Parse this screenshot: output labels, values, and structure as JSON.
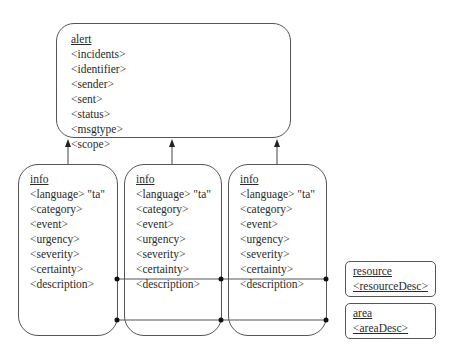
{
  "alert": {
    "title": "alert",
    "fields": [
      "<incidents>",
      "<identifier>",
      "<sender>",
      "<sent>",
      "<status>",
      "<msgtype>",
      "<scope>"
    ]
  },
  "info_blocks": [
    {
      "title": "info",
      "fields": [
        "<language> \"ta\"",
        "<category>",
        "<event>",
        "<urgency>",
        "<severity>",
        "<certainty>",
        "<description>"
      ]
    },
    {
      "title": "info",
      "fields": [
        "<language> \"ta\"",
        "<category>",
        "<event>",
        "<urgency>",
        "<severity>",
        "<certainty>",
        "<description>"
      ]
    },
    {
      "title": "info",
      "fields": [
        "<language> \"ta\"",
        "<category>",
        "<event>",
        "<urgency>",
        "<severity>",
        "<certainty>",
        "<description>"
      ]
    }
  ],
  "resource": {
    "title": "resource",
    "field": "<resourceDesc>"
  },
  "area": {
    "title": "area",
    "field": "<areaDesc>"
  },
  "colors": {
    "stroke": "#555555",
    "text": "#2a2a2a",
    "background": "#ffffff"
  }
}
